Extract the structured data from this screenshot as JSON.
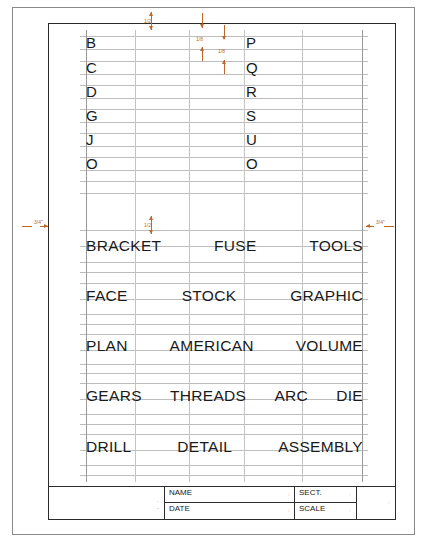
{
  "sheet": {
    "title": "Lettering practice sheet",
    "single_letters": {
      "left_column": [
        "B",
        "C",
        "D",
        "G",
        "J",
        "O"
      ],
      "right_column": [
        "P",
        "Q",
        "R",
        "S",
        "U",
        "O"
      ]
    },
    "word_rows": [
      [
        "BRACKET",
        "FUSE",
        "TOOLS"
      ],
      [
        "FACE",
        "STOCK",
        "GRAPHIC"
      ],
      [
        "PLAN",
        "AMERICAN",
        "VOLUME"
      ],
      [
        "GEARS",
        "THREADS",
        "ARC",
        "DIE"
      ],
      [
        "DRILL",
        "DETAIL",
        "ASSEMBLY"
      ]
    ],
    "dimensions": {
      "top_margin": "1/2",
      "cap_height_1": "1/8",
      "cap_height_2": "1/8",
      "left_margin": "3/4\"",
      "right_margin": "3/4\"",
      "word_spacing": "1/2"
    },
    "colors": {
      "dimension": "#c0662a",
      "guideline": "#bdbdbd",
      "border": "#2b2b2b",
      "text": "#1a1a1a"
    }
  },
  "title_block": {
    "name_label": "NAME",
    "date_label": "DATE",
    "sect_label": "SECT.",
    "scale_label": "SCALE"
  }
}
